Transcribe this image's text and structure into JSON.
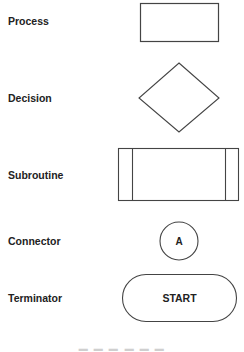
{
  "diagram": {
    "stroke_color": "#444444",
    "symbols": [
      {
        "label": "Process",
        "shape": "rectangle",
        "text": ""
      },
      {
        "label": "Decision",
        "shape": "diamond",
        "text": ""
      },
      {
        "label": "Subroutine",
        "shape": "rectangle-with-side-bars",
        "text": ""
      },
      {
        "label": "Connector",
        "shape": "circle",
        "text": "A"
      },
      {
        "label": "Terminator",
        "shape": "rounded-pill",
        "text": "START"
      }
    ]
  }
}
